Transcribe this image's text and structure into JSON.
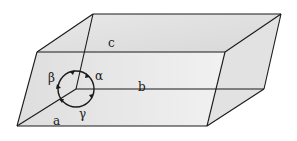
{
  "diagram": {
    "edge_labels": {
      "a": "a",
      "b": "b",
      "c": "c"
    },
    "angle_labels": {
      "alpha": "α",
      "beta": "β",
      "gamma": "γ"
    },
    "colors": {
      "face_fill": "#e6e6e6",
      "edge_stroke": "#1a1a1a",
      "background": "#ffffff"
    }
  }
}
